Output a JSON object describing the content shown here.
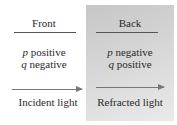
{
  "diagram": {
    "front": {
      "heading": "Front",
      "line1_var": "p",
      "line1_text": " positive",
      "line2_var": "q",
      "line2_text": " negative",
      "arrow_caption": "Incident light"
    },
    "back": {
      "heading": "Back",
      "line1_var": "p",
      "line1_text": " negative",
      "line2_var": "q",
      "line2_text": " positive",
      "arrow_caption": "Refracted light"
    },
    "colors": {
      "back_panel": "#d4d4d4",
      "text": "#2a2a2a",
      "arrow": "#777777"
    }
  }
}
